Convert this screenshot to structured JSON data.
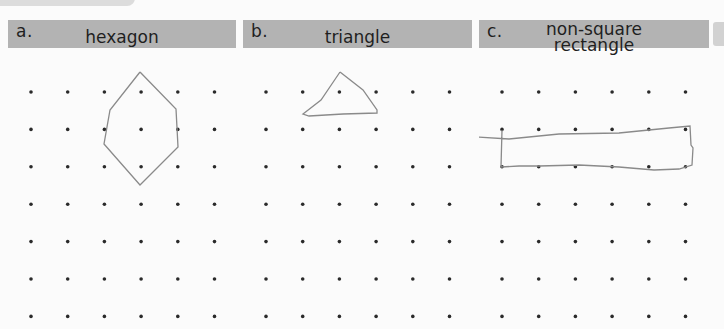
{
  "worksheet": {
    "panels": [
      {
        "letter": "a.",
        "title_lines": [
          "hexagon"
        ],
        "shape": "hexagon",
        "vertices": [
          [
            3,
            1
          ],
          [
            4,
            2
          ],
          [
            4,
            3
          ],
          [
            3,
            4
          ],
          [
            2,
            3
          ],
          [
            2,
            2
          ]
        ]
      },
      {
        "letter": "b.",
        "title_lines": [
          "triangle"
        ],
        "shape": "triangle",
        "vertices": [
          [
            2,
            1
          ],
          [
            3,
            2
          ],
          [
            1,
            2
          ]
        ]
      },
      {
        "letter": "c.",
        "title_lines": [
          "non-square",
          "rectangle"
        ],
        "shape": "non-square rectangle",
        "vertices": [
          [
            0,
            2
          ],
          [
            5,
            2
          ],
          [
            5,
            3
          ],
          [
            0,
            3
          ]
        ]
      }
    ],
    "grid": {
      "columns": 6,
      "rows": 7
    },
    "colors": {
      "header_bg": "#b3b3b3",
      "header_text": "#1f1f1f",
      "dot": "#2a2a2a",
      "pencil": "#8a8a8a"
    }
  }
}
